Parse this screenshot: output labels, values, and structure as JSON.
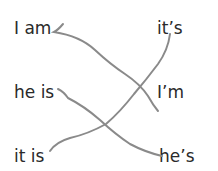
{
  "worksheet": {
    "left_column": [
      "I am",
      "he is",
      "it is"
    ],
    "right_column": [
      "it’s",
      "I’m",
      "he’s"
    ],
    "matches": [
      {
        "from": "I am",
        "to": "I’m"
      },
      {
        "from": "he is",
        "to": "he’s"
      },
      {
        "from": "it is",
        "to": "it’s"
      }
    ],
    "line_color": "#8a8a8a"
  }
}
